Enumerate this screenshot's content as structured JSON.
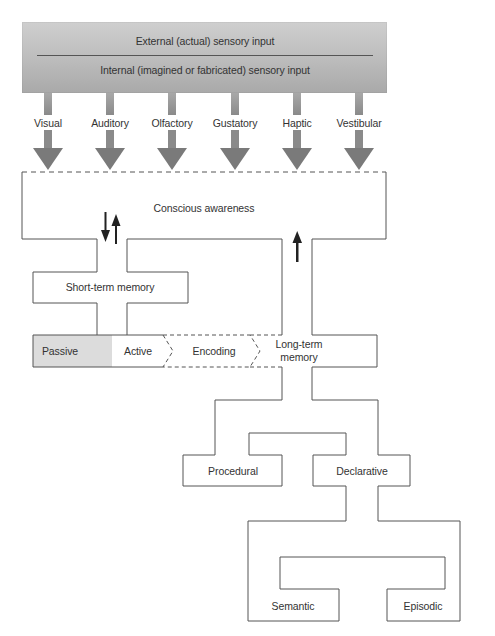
{
  "sensory_input": {
    "external": "External (actual) sensory input",
    "internal": "Internal (imagined or fabricated) sensory input"
  },
  "senses": [
    {
      "label": "Visual",
      "x": 48
    },
    {
      "label": "Auditory",
      "x": 110
    },
    {
      "label": "Olfactory",
      "x": 172
    },
    {
      "label": "Gustatory",
      "x": 235
    },
    {
      "label": "Haptic",
      "x": 297
    },
    {
      "label": "Vestibular",
      "x": 359
    }
  ],
  "nodes": {
    "conscious": "Conscious awareness",
    "short_term": "Short-term memory",
    "passive": "Passive",
    "active": "Active",
    "encoding": "Encoding",
    "long_term_line1": "Long-term",
    "long_term_line2": "memory",
    "procedural": "Procedural",
    "declarative": "Declarative",
    "semantic": "Semantic",
    "episodic": "Episodic"
  },
  "colors": {
    "line": "#555555",
    "arrow": "#7a7a7a",
    "arrow_stem": "#a0a0a0",
    "passive_fill": "#dcdcdc",
    "bold_arrow": "#222222"
  }
}
